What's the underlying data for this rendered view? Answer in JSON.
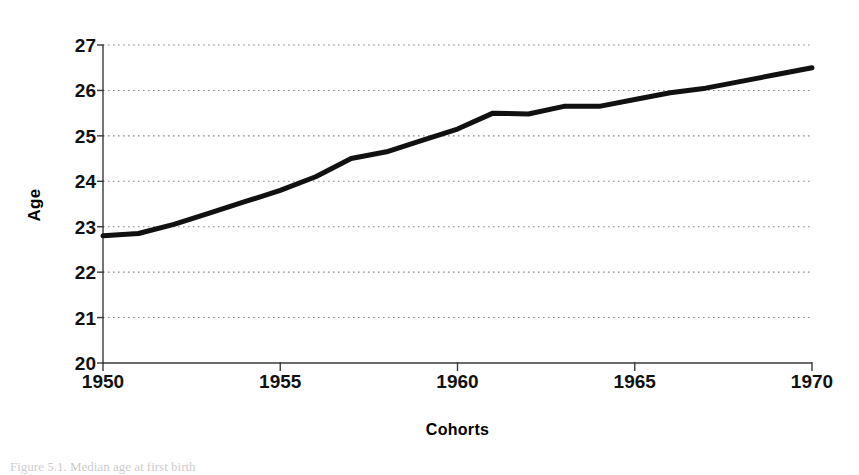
{
  "figure": {
    "caption_fragment": "Figure 5.1.  Median age at first birth"
  },
  "chart_data": {
    "type": "line",
    "title": "",
    "xlabel": "Cohorts",
    "ylabel": "Age",
    "xlim": [
      1950,
      1970
    ],
    "ylim": [
      20,
      27
    ],
    "grid": true,
    "grid_style": "dotted-horizontal",
    "legend": "none",
    "x_ticks": [
      1950,
      1955,
      1960,
      1965,
      1970
    ],
    "x_tick_labels": [
      "1950",
      "1955",
      "1960",
      "1965",
      "1970"
    ],
    "y_ticks": [
      20,
      21,
      22,
      23,
      24,
      25,
      26,
      27
    ],
    "y_tick_labels": [
      "20",
      "21",
      "22",
      "23",
      "24",
      "25",
      "26",
      "27"
    ],
    "series": [
      {
        "name": "Age at first birth",
        "color": "#111111",
        "line_width": 5,
        "x": [
          1950,
          1951,
          1952,
          1953,
          1954,
          1955,
          1956,
          1957,
          1958,
          1959,
          1960,
          1961,
          1962,
          1963,
          1964,
          1965,
          1966,
          1967,
          1968,
          1969,
          1970
        ],
        "values": [
          22.8,
          22.85,
          23.05,
          23.3,
          23.55,
          23.8,
          24.1,
          24.5,
          24.65,
          24.9,
          25.15,
          25.5,
          25.48,
          25.65,
          25.65,
          25.8,
          25.95,
          26.05,
          26.2,
          26.35,
          26.5
        ]
      }
    ]
  },
  "geometry": {
    "plot_left": 103,
    "plot_right": 812,
    "plot_top": 45,
    "plot_bottom": 363
  },
  "colors": {
    "line": "#111111",
    "axis": "#3a3a3a",
    "grid": "#8a8a8a",
    "background": "#ffffff"
  }
}
